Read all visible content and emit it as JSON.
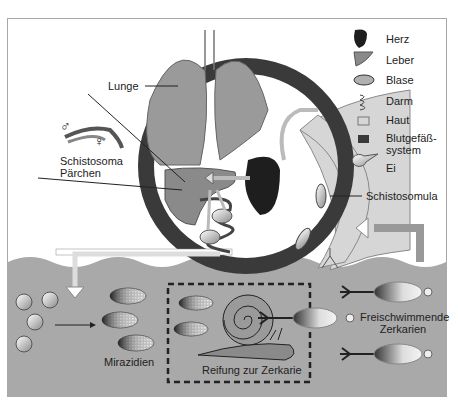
{
  "diagram": {
    "legend": [
      {
        "label": "Herz",
        "icon": "heart-icon"
      },
      {
        "label": "Leber",
        "icon": "liver-icon"
      },
      {
        "label": "Blase",
        "icon": "bladder-icon"
      },
      {
        "label": "Darm",
        "icon": "intestine-icon"
      },
      {
        "label": "Haut",
        "icon": "skin-swatch-icon"
      },
      {
        "label": "Blutgefäß-",
        "label2": "system",
        "icon": "blood-vessel-swatch-icon"
      },
      {
        "label": "Ei",
        "icon": "egg-icon"
      }
    ],
    "labels": {
      "lunge": "Lunge",
      "schistosoma": "Schistosoma",
      "paerchen": "Pärchen",
      "male": "♂",
      "female": "♀",
      "schistosomula": "Schistosomula",
      "mirazidien": "Mirazidien",
      "reifung": "Reifung zur Zerkarie",
      "freischwimmende": "Freischwimmende",
      "zerkarien": "Zerkarien"
    },
    "colors": {
      "water": "#a9a9a9",
      "organ": "#8f8f8f",
      "vessel": "#3a3a3a",
      "skin": "#d6d6d6",
      "heart": "#1e1e1e"
    }
  }
}
